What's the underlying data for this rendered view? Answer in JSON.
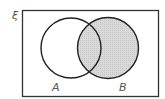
{
  "diagram": {
    "type": "venn",
    "universal_label": "ξ",
    "sets": [
      {
        "name": "A",
        "label": "A",
        "shaded": false
      },
      {
        "name": "B",
        "label": "B",
        "shaded": true
      }
    ],
    "shaded_region": "B",
    "colors": {
      "outline": "#222222",
      "shade": "#d6d6d6",
      "background": "#ffffff",
      "label": "#555555"
    }
  }
}
